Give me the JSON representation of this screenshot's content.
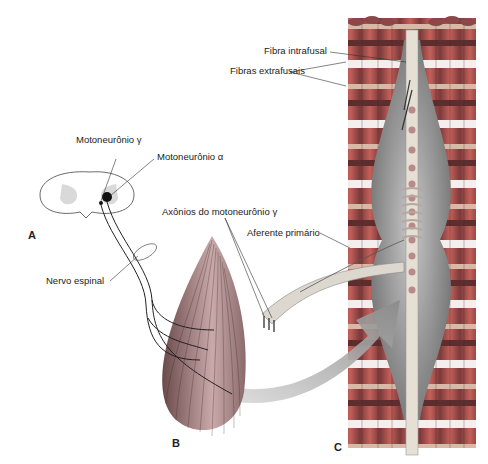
{
  "figure": {
    "panels": {
      "a": "A",
      "b": "B",
      "c": "C"
    },
    "labels": {
      "motoneuron_gamma": "Motoneurônio γ",
      "motoneuron_alpha": "Motoneurônio α",
      "spinal_nerve": "Nervo espinal",
      "gamma_axons": "Axônios do motoneurônio γ",
      "primary_afferent": "Aferente primário",
      "intrafusal_fiber": "Fibra intrafusal",
      "extrafusal_fibers": "Fibras extrafusais"
    },
    "colors": {
      "extrafusal_red": "#b5504a",
      "extrafusal_dark": "#7a3a3a",
      "capsule_gray": "#8a8a8a",
      "spindle_light": "#d8d2c8",
      "gray_matter": "#d9d9d9",
      "arrow_gray": "#9a9a9a"
    }
  }
}
